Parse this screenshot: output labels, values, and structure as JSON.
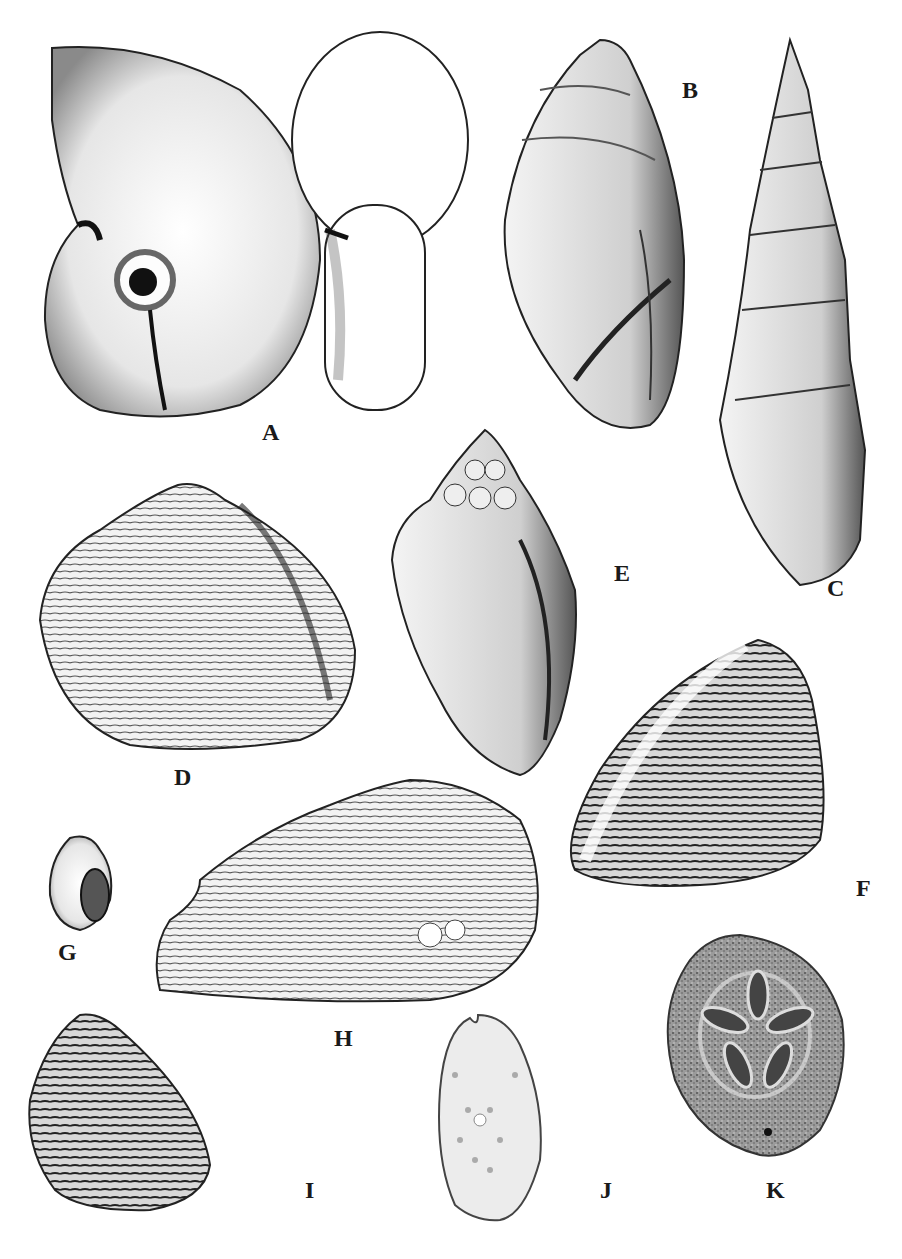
{
  "plate": {
    "background": "#ffffff",
    "ink": "#1a1a1a",
    "specimens": [
      {
        "id": "A",
        "label": "A",
        "kind": "coiled gastropod (two views)",
        "label_pos": [
          262,
          432
        ]
      },
      {
        "id": "B",
        "label": "B",
        "kind": "ovate gastropod",
        "label_pos": [
          682,
          78
        ]
      },
      {
        "id": "C",
        "label": "C",
        "kind": "high-spired turreted gastropod",
        "label_pos": [
          827,
          576
        ]
      },
      {
        "id": "D",
        "label": "D",
        "kind": "triangular bivalve",
        "label_pos": [
          174,
          765
        ]
      },
      {
        "id": "E",
        "label": "E",
        "kind": "knobbed spindle gastropod",
        "label_pos": [
          614,
          561
        ]
      },
      {
        "id": "F",
        "label": "F",
        "kind": "ribbed bivalve",
        "label_pos": [
          856,
          888
        ]
      },
      {
        "id": "G",
        "label": "G",
        "kind": "small globose gastropod",
        "label_pos": [
          58,
          950
        ]
      },
      {
        "id": "H",
        "label": "H",
        "kind": "elongate bivalve",
        "label_pos": [
          334,
          1026
        ]
      },
      {
        "id": "I",
        "label": "I",
        "kind": "concentrically ribbed bivalve",
        "label_pos": [
          305,
          1178
        ]
      },
      {
        "id": "J",
        "label": "J",
        "kind": "heart urchin (echinoid)",
        "label_pos": [
          600,
          1178
        ]
      },
      {
        "id": "K",
        "label": "K",
        "kind": "sand dollar (petaloid echinoid)",
        "label_pos": [
          766,
          1178
        ]
      }
    ]
  }
}
